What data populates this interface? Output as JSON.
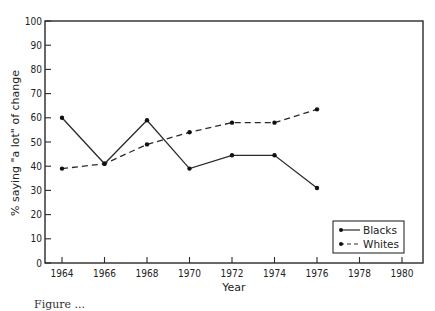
{
  "chart_data": {
    "type": "line",
    "title": "",
    "xlabel": "Year",
    "ylabel": "% saying \"a lot\" of change",
    "x": [
      1964,
      1966,
      1968,
      1970,
      1972,
      1974,
      1976
    ],
    "x_ticks": [
      1964,
      1966,
      1968,
      1970,
      1972,
      1974,
      1976,
      1978,
      1980
    ],
    "y_ticks": [
      0,
      10,
      20,
      30,
      40,
      50,
      60,
      70,
      80,
      90,
      100
    ],
    "xlim": [
      1964,
      1980
    ],
    "ylim": [
      0,
      100
    ],
    "grid": false,
    "legend_position": "lower right",
    "series": [
      {
        "name": "Blacks",
        "style": "solid",
        "values": [
          60,
          41,
          59,
          39,
          44.5,
          44.5,
          31
        ]
      },
      {
        "name": "Whites",
        "style": "dashed",
        "values": [
          39,
          41,
          49,
          54,
          58,
          58,
          63.5
        ]
      }
    ]
  },
  "caption": "Figure ..."
}
